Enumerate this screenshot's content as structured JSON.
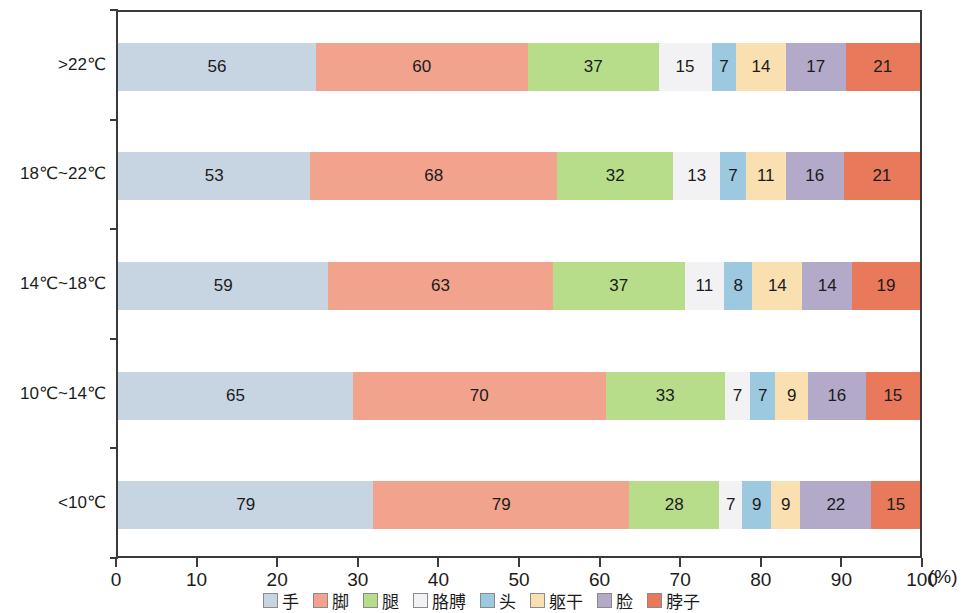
{
  "chart_data": {
    "type": "bar",
    "orientation": "horizontal",
    "stacked": true,
    "normalized_to_percent": true,
    "title": "",
    "subtitle": "",
    "xlabel": "(%)",
    "ylabel": "",
    "xlim": [
      0,
      100
    ],
    "grid": false,
    "legend_position": "bottom",
    "x_ticks": [
      0,
      10,
      20,
      30,
      40,
      50,
      60,
      70,
      80,
      90,
      100
    ],
    "x_tick_labels": [
      "0",
      "10",
      "20",
      "30",
      "40",
      "50",
      "60",
      "70",
      "80",
      "90",
      "100"
    ],
    "x_unit": "(%)",
    "categories": [
      ">22℃",
      "18℃~22℃",
      "14℃~18℃",
      "10℃~14℃",
      "<10℃"
    ],
    "series": [
      {
        "name": "手",
        "color": "#c7d5e2",
        "values": [
          56,
          53,
          59,
          65,
          79
        ]
      },
      {
        "name": "脚",
        "color": "#f2a38d",
        "values": [
          60,
          68,
          63,
          70,
          79
        ]
      },
      {
        "name": "腿",
        "color": "#b7dd8a",
        "values": [
          37,
          32,
          37,
          33,
          28
        ]
      },
      {
        "name": "胳膊",
        "color": "#f2f2f4",
        "values": [
          15,
          13,
          11,
          7,
          7
        ]
      },
      {
        "name": "头",
        "color": "#9cc8e0",
        "values": [
          7,
          7,
          8,
          7,
          9
        ]
      },
      {
        "name": "躯干",
        "color": "#fadfb0",
        "values": [
          14,
          11,
          14,
          9,
          9
        ]
      },
      {
        "name": "脸",
        "color": "#b3aac9",
        "values": [
          17,
          16,
          14,
          16,
          22
        ]
      },
      {
        "name": "脖子",
        "color": "#e8795a",
        "values": [
          21,
          21,
          19,
          15,
          15
        ]
      }
    ],
    "legend": [
      {
        "label": "手",
        "color": "#c7d5e2"
      },
      {
        "label": "脚",
        "color": "#f2a38d"
      },
      {
        "label": "腿",
        "color": "#b7dd8a"
      },
      {
        "label": "胳膊",
        "color": "#f2f2f4"
      },
      {
        "label": "头",
        "color": "#9cc8e0"
      },
      {
        "label": "躯干",
        "color": "#fadfb0"
      },
      {
        "label": "脸",
        "color": "#b3aac9"
      },
      {
        "label": "脖子",
        "color": "#e8795a"
      }
    ],
    "rows": [
      {
        "category": ">22℃",
        "segments": [
          {
            "name": "手",
            "value": 56,
            "color": "#c7d5e2"
          },
          {
            "name": "脚",
            "value": 60,
            "color": "#f2a38d"
          },
          {
            "name": "腿",
            "value": 37,
            "color": "#b7dd8a"
          },
          {
            "name": "胳膊",
            "value": 15,
            "color": "#f2f2f4"
          },
          {
            "name": "头",
            "value": 7,
            "color": "#9cc8e0"
          },
          {
            "name": "躯干",
            "value": 14,
            "color": "#fadfb0"
          },
          {
            "name": "脸",
            "value": 17,
            "color": "#b3aac9"
          },
          {
            "name": "脖子",
            "value": 21,
            "color": "#e8795a"
          }
        ]
      },
      {
        "category": "18℃~22℃",
        "segments": [
          {
            "name": "手",
            "value": 53,
            "color": "#c7d5e2"
          },
          {
            "name": "脚",
            "value": 68,
            "color": "#f2a38d"
          },
          {
            "name": "腿",
            "value": 32,
            "color": "#b7dd8a"
          },
          {
            "name": "胳膊",
            "value": 13,
            "color": "#f2f2f4"
          },
          {
            "name": "头",
            "value": 7,
            "color": "#9cc8e0"
          },
          {
            "name": "躯干",
            "value": 11,
            "color": "#fadfb0"
          },
          {
            "name": "脸",
            "value": 16,
            "color": "#b3aac9"
          },
          {
            "name": "脖子",
            "value": 21,
            "color": "#e8795a"
          }
        ]
      },
      {
        "category": "14℃~18℃",
        "segments": [
          {
            "name": "手",
            "value": 59,
            "color": "#c7d5e2"
          },
          {
            "name": "脚",
            "value": 63,
            "color": "#f2a38d"
          },
          {
            "name": "腿",
            "value": 37,
            "color": "#b7dd8a"
          },
          {
            "name": "胳膊",
            "value": 11,
            "color": "#f2f2f4"
          },
          {
            "name": "头",
            "value": 8,
            "color": "#9cc8e0"
          },
          {
            "name": "躯干",
            "value": 14,
            "color": "#fadfb0"
          },
          {
            "name": "脸",
            "value": 14,
            "color": "#b3aac9"
          },
          {
            "name": "脖子",
            "value": 19,
            "color": "#e8795a"
          }
        ]
      },
      {
        "category": "10℃~14℃",
        "segments": [
          {
            "name": "手",
            "value": 65,
            "color": "#c7d5e2"
          },
          {
            "name": "脚",
            "value": 70,
            "color": "#f2a38d"
          },
          {
            "name": "腿",
            "value": 33,
            "color": "#b7dd8a"
          },
          {
            "name": "胳膊",
            "value": 7,
            "color": "#f2f2f4"
          },
          {
            "name": "头",
            "value": 7,
            "color": "#9cc8e0"
          },
          {
            "name": "躯干",
            "value": 9,
            "color": "#fadfb0"
          },
          {
            "name": "脸",
            "value": 16,
            "color": "#b3aac9"
          },
          {
            "name": "脖子",
            "value": 15,
            "color": "#e8795a"
          }
        ]
      },
      {
        "category": "<10℃",
        "segments": [
          {
            "name": "手",
            "value": 79,
            "color": "#c7d5e2"
          },
          {
            "name": "脚",
            "value": 79,
            "color": "#f2a38d"
          },
          {
            "name": "腿",
            "value": 28,
            "color": "#b7dd8a"
          },
          {
            "name": "胳膊",
            "value": 7,
            "color": "#f2f2f4"
          },
          {
            "name": "头",
            "value": 9,
            "color": "#9cc8e0"
          },
          {
            "name": "躯干",
            "value": 9,
            "color": "#fadfb0"
          },
          {
            "name": "脸",
            "value": 22,
            "color": "#b3aac9"
          },
          {
            "name": "脖子",
            "value": 15,
            "color": "#e8795a"
          }
        ]
      }
    ]
  },
  "axis_colors": {
    "spine": "#3a3a3a",
    "text": "#1b1b1b"
  }
}
